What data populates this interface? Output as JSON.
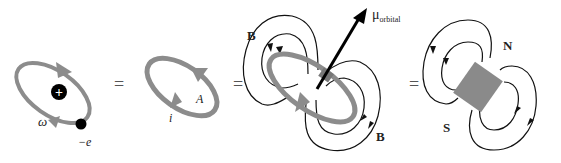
{
  "colors": {
    "loop": "#8c8c8c",
    "field_line": "#111111",
    "magnet": "#8a8a8a",
    "dipole_arrow": "#000000",
    "nucleus": "#000000",
    "electron": "#000000",
    "equals": "#555555"
  },
  "panels": [
    {
      "id": "orbiting-electron",
      "labels": {
        "angular_velocity": "ω",
        "electron_charge": "−e",
        "nucleus_symbol": "+"
      }
    },
    {
      "id": "current-loop",
      "labels": {
        "area": "A",
        "current": "i"
      }
    },
    {
      "id": "loop-with-field",
      "labels": {
        "field_top": "B",
        "field_bottom": "B",
        "moment_base": "μ",
        "moment_subscript": "orbital"
      }
    },
    {
      "id": "bar-magnet",
      "labels": {
        "north": "N",
        "south": "S"
      }
    }
  ],
  "equals": [
    "=",
    "=",
    "="
  ]
}
